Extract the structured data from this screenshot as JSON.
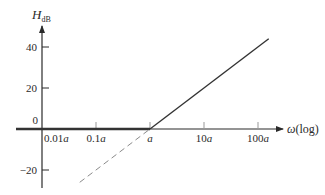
{
  "chart_data": {
    "type": "line",
    "title": "",
    "xlabel": "ω(log)",
    "ylabel": {
      "main": "H",
      "sub": "dB"
    },
    "x_scale": "log",
    "x_ticks": [
      {
        "value": 0.01,
        "label": "0.01",
        "var": "a"
      },
      {
        "value": 0.1,
        "label": "0.1",
        "var": "a"
      },
      {
        "value": 1,
        "label": "",
        "var": "a"
      },
      {
        "value": 10,
        "label": "10",
        "var": "a"
      },
      {
        "value": 100,
        "label": "100",
        "var": "a"
      }
    ],
    "y_ticks": [
      {
        "value": 40,
        "label": "40"
      },
      {
        "value": 20,
        "label": "20"
      },
      {
        "value": 0,
        "label": "0"
      },
      {
        "value": -20,
        "label": "−20"
      }
    ],
    "ylim": [
      -29,
      50
    ],
    "xlim_decades_rel_a": [
      -2.5,
      2.4
    ],
    "grid": false,
    "legend": null,
    "series": [
      {
        "name": "asymptote-flat",
        "style": "solid-thick",
        "x": [
          0.006,
          1
        ],
        "y": [
          0,
          0
        ]
      },
      {
        "name": "asymptote-rising",
        "style": "solid",
        "slope": "20 dB/decade",
        "x": [
          1,
          158
        ],
        "y": [
          0,
          44
        ]
      },
      {
        "name": "asymptote-extension",
        "style": "dashed",
        "x": [
          0.05,
          1
        ],
        "y": [
          -26,
          0
        ]
      }
    ],
    "colors": {
      "axis": "#2a2a2a",
      "solid": "#333333",
      "dashed": "#8a8a8a"
    }
  }
}
